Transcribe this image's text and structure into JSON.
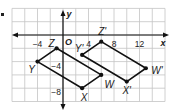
{
  "figure": {
    "bullet": "•",
    "colors": {
      "background": "#ffffff",
      "grid": "#c4c4c4",
      "axis": "#111111",
      "shape": "#111111",
      "text": "#1a1a1a"
    },
    "axes": {
      "x_label": "x",
      "y_label": "y",
      "origin_label": "O",
      "x_range": [
        -8,
        16
      ],
      "y_range": [
        -10,
        4
      ],
      "grid_step": 2,
      "x_ticks": [
        {
          "value": -4,
          "label": "−4"
        },
        {
          "value": 4,
          "label": "4"
        },
        {
          "value": 8,
          "label": "8"
        },
        {
          "value": 12,
          "label": "12"
        }
      ],
      "y_ticks": [
        {
          "value": -4,
          "label": "−4"
        },
        {
          "value": -8,
          "label": "−8"
        }
      ]
    },
    "shapes": [
      {
        "name": "WXYZ",
        "vertices": [
          {
            "label": "W",
            "x": 6,
            "y": -6,
            "label_dx": 8,
            "label_dy": 10
          },
          {
            "label": "X",
            "x": 3,
            "y": -8,
            "label_dx": 2,
            "label_dy": 9
          },
          {
            "label": "Y",
            "x": -4,
            "y": -4,
            "label_dx": -6,
            "label_dy": 8
          },
          {
            "label": "Z",
            "x": -1,
            "y": -2,
            "label_dx": -5,
            "label_dy": -5
          }
        ]
      },
      {
        "name": "W'X'Y'Z'",
        "vertices": [
          {
            "label": "W'",
            "x": 13,
            "y": -5,
            "label_dx": 11,
            "label_dy": 2
          },
          {
            "label": "X'",
            "x": 10,
            "y": -7,
            "label_dx": 0,
            "label_dy": 9
          },
          {
            "label": "Y'",
            "x": 3,
            "y": -3,
            "label_dx": -3,
            "label_dy": -6
          },
          {
            "label": "Z'",
            "x": 6,
            "y": -1,
            "label_dx": 1,
            "label_dy": -10
          }
        ]
      }
    ]
  }
}
